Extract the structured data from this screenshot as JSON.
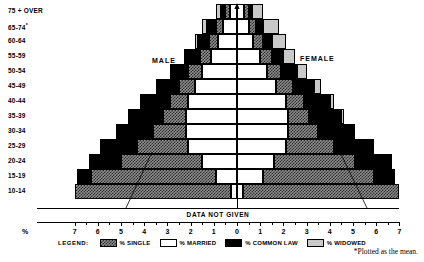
{
  "chart_data": {
    "type": "bar",
    "title": "",
    "subtitle": "",
    "orientation": "population-pyramid",
    "xlabel": "%",
    "ylabel": "",
    "xlim": [
      -7.5,
      7.5
    ],
    "x_tick_labels": [
      "7",
      "6",
      "5",
      "4",
      "3",
      "2",
      "1",
      "0",
      "1",
      "2",
      "3",
      "4",
      "5",
      "6",
      "7"
    ],
    "x_tick_values": [
      -7,
      -6,
      -5,
      -4,
      -3,
      -2,
      -1,
      0,
      1,
      2,
      3,
      4,
      5,
      6,
      7
    ],
    "grid": false,
    "legend_position": "bottom",
    "categories": [
      "10-14",
      "15-19",
      "20-24",
      "25-29",
      "30-34",
      "35-39",
      "40-44",
      "45-49",
      "50-54",
      "55-59",
      "60-64",
      "65-74",
      "75 + OVER"
    ],
    "side_labels": {
      "left": "MALE",
      "right": "FEMALE"
    },
    "series": [
      {
        "name": "% MARRIED",
        "key": "married",
        "color": "#ffffff",
        "pattern": "solid-white"
      },
      {
        "name": "% SINGLE",
        "key": "single",
        "color": "#8f8f8f",
        "pattern": "checkered"
      },
      {
        "name": "% COMMON LAW",
        "key": "commonlaw",
        "color": "#000000",
        "pattern": "solid-black"
      },
      {
        "name": "% WIDOWED",
        "key": "widowed",
        "color": "#c9c9c9",
        "pattern": "solid-gray"
      }
    ],
    "note": "Segments are stacked outward from the 0 center line in the order: married, single, common law, widowed.",
    "rows": [
      {
        "age": "10-14",
        "data_not_given": true,
        "male": {
          "married": 0.25,
          "single": 6.75,
          "commonlaw": 0.0,
          "widowed": 0.0
        },
        "female": {
          "married": 0.25,
          "single": 6.75,
          "commonlaw": 0.0,
          "widowed": 0.0
        }
      },
      {
        "age": "15-19",
        "male": {
          "married": 0.9,
          "single": 5.4,
          "commonlaw": 0.6,
          "widowed": 0.0
        },
        "female": {
          "married": 1.1,
          "single": 4.8,
          "commonlaw": 0.9,
          "widowed": 0.0
        }
      },
      {
        "age": "20-24",
        "male": {
          "married": 1.5,
          "single": 3.5,
          "commonlaw": 1.4,
          "widowed": 0.0
        },
        "female": {
          "married": 1.6,
          "single": 3.5,
          "commonlaw": 1.5,
          "widowed": 0.1
        }
      },
      {
        "age": "25-29",
        "male": {
          "married": 2.1,
          "single": 2.2,
          "commonlaw": 1.6,
          "widowed": 0.0
        },
        "female": {
          "married": 2.1,
          "single": 2.1,
          "commonlaw": 1.6,
          "widowed": 0.1
        }
      },
      {
        "age": "30-34",
        "male": {
          "married": 2.2,
          "single": 1.4,
          "commonlaw": 1.6,
          "widowed": 0.0
        },
        "female": {
          "married": 2.2,
          "single": 1.3,
          "commonlaw": 1.5,
          "widowed": 0.1
        }
      },
      {
        "age": "35-39",
        "male": {
          "married": 2.2,
          "single": 1.0,
          "commonlaw": 1.5,
          "widowed": 0.0
        },
        "female": {
          "married": 2.2,
          "single": 0.9,
          "commonlaw": 1.4,
          "widowed": 0.1
        }
      },
      {
        "age": "40-44",
        "male": {
          "married": 2.1,
          "single": 0.8,
          "commonlaw": 1.3,
          "widowed": 0.0
        },
        "female": {
          "married": 2.1,
          "single": 0.8,
          "commonlaw": 1.1,
          "widowed": 0.2
        }
      },
      {
        "age": "45-49",
        "male": {
          "married": 1.8,
          "single": 0.7,
          "commonlaw": 1.0,
          "widowed": 0.0
        },
        "female": {
          "married": 1.7,
          "single": 0.7,
          "commonlaw": 0.9,
          "widowed": 0.3
        }
      },
      {
        "age": "50-54",
        "male": {
          "married": 1.5,
          "single": 0.6,
          "commonlaw": 0.8,
          "widowed": 0.0
        },
        "female": {
          "married": 1.3,
          "single": 0.6,
          "commonlaw": 0.7,
          "widowed": 0.4
        }
      },
      {
        "age": "55-59",
        "male": {
          "married": 1.1,
          "single": 0.5,
          "commonlaw": 0.6,
          "widowed": 0.1
        },
        "female": {
          "married": 1.0,
          "single": 0.5,
          "commonlaw": 0.5,
          "widowed": 0.5
        }
      },
      {
        "age": "60-64",
        "male": {
          "married": 0.8,
          "single": 0.4,
          "commonlaw": 0.5,
          "widowed": 0.1
        },
        "female": {
          "married": 0.7,
          "single": 0.4,
          "commonlaw": 0.4,
          "widowed": 0.6
        }
      },
      {
        "age": "65-74",
        "male": {
          "married": 0.6,
          "single": 0.3,
          "commonlaw": 0.4,
          "widowed": 0.2
        },
        "female": {
          "married": 0.5,
          "single": 0.3,
          "commonlaw": 0.3,
          "widowed": 0.7
        }
      },
      {
        "age": "75 + OVER",
        "male": {
          "married": 0.3,
          "single": 0.2,
          "commonlaw": 0.2,
          "widowed": 0.2
        },
        "female": {
          "married": 0.3,
          "single": 0.2,
          "commonlaw": 0.15,
          "widowed": 0.45
        }
      }
    ]
  },
  "axis": {
    "percent_symbol": "%",
    "age_labels": [
      {
        "text": "75 + OVER",
        "star": ""
      },
      {
        "text": "65-74",
        "star": "*"
      },
      {
        "text": "60-64",
        "star": ""
      },
      {
        "text": "55-59",
        "star": ""
      },
      {
        "text": "50-54",
        "star": ""
      },
      {
        "text": "45-49",
        "star": ""
      },
      {
        "text": "40-44",
        "star": ""
      },
      {
        "text": "35-39",
        "star": ""
      },
      {
        "text": "30-34",
        "star": ""
      },
      {
        "text": "25-29",
        "star": ""
      },
      {
        "text": "20-24",
        "star": ""
      },
      {
        "text": "15-19",
        "star": ""
      },
      {
        "text": "10-14",
        "star": ""
      }
    ]
  },
  "annotations": {
    "male": "MALE",
    "female": "FEMALE",
    "data_not_given": "DATA NOT GIVEN",
    "footnote": "*Plotted as the mean."
  },
  "legend": {
    "title": "LEGEND:",
    "items": [
      {
        "label": "% SINGLE",
        "style": "single"
      },
      {
        "label": "% MARRIED",
        "style": "married"
      },
      {
        "label": "% COMMON LAW",
        "style": "commonlaw"
      },
      {
        "label": "% WIDOWED",
        "style": "widowed"
      }
    ]
  }
}
